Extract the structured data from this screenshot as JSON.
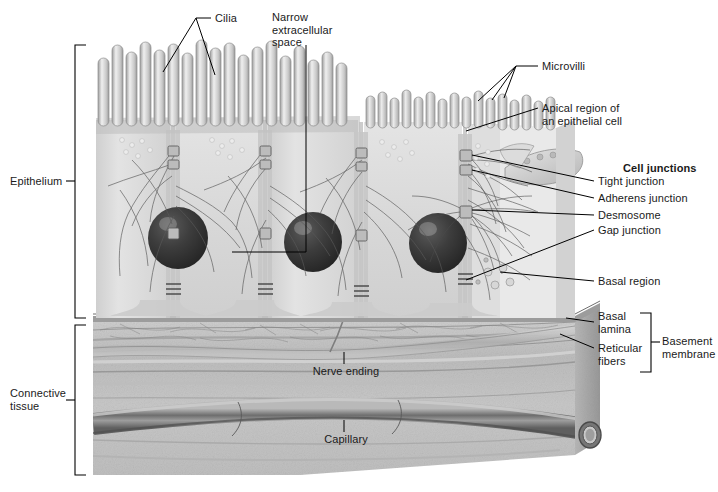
{
  "figure": {
    "kind": "biological-illustration",
    "style": "grayscale textbook diagram"
  },
  "palette": {
    "background": "#ffffff",
    "leader_line": "#000000",
    "bracket": "#000000",
    "text": "#1a1a1a",
    "epithelium_cytoplasm": "#d9d9d9",
    "epithelium_light": "#e8e8e8",
    "cilia_light": "#ededed",
    "cilia_shade": "#a8a8a8",
    "nucleus_dark": "#3c3c3c",
    "nucleus_core": "#2a2a2a",
    "connective_tissue": "#c4c4c4",
    "connective_dark": "#9a9a9a",
    "block_side": "#b0b0b0",
    "capillary": "#8f8f8f"
  },
  "labels": {
    "cilia": "Cilia",
    "narrow_extracellular_space": "Narrow\nextracellular\nspace",
    "microvilli": "Microvilli",
    "apical_region": "Apical region of\nan epithelial cell",
    "cell_junctions": "Cell junctions",
    "tight_junction": "Tight junction",
    "adherens_junction": "Adherens junction",
    "desmosome": "Desmosome",
    "gap_junction": "Gap junction",
    "basal_region": "Basal region",
    "basal_lamina": "Basal\nlamina",
    "reticular_fibers": "Reticular\nfibers",
    "basement_membrane": "Basement\nmembrane",
    "epithelium": "Epithelium",
    "connective_tissue": "Connective\ntissue",
    "nerve_ending": "Nerve ending",
    "capillary": "Capillary"
  },
  "brackets": [
    {
      "name": "epithelium-bracket",
      "label": "Epithelium",
      "side": "left",
      "top": 45,
      "bottom": 318
    },
    {
      "name": "connective-tissue-bracket",
      "label": "Connective tissue",
      "side": "left",
      "top": 325,
      "bottom": 475
    },
    {
      "name": "basement-membrane-bracket",
      "label": "Basement membrane",
      "side": "right",
      "top": 313,
      "bottom": 372
    }
  ],
  "structures": [
    {
      "name": "cilia",
      "count": 16,
      "region": "apical surface, left two cells"
    },
    {
      "name": "microvilli",
      "count": 14,
      "region": "apical surface, right cell"
    },
    {
      "name": "epithelial-cells",
      "count": 4
    },
    {
      "name": "nuclei",
      "count": 3
    },
    {
      "name": "capillary",
      "count": 1,
      "region": "connective tissue"
    },
    {
      "name": "nerve-ending",
      "count": 1,
      "region": "connective tissue"
    }
  ]
}
